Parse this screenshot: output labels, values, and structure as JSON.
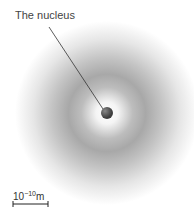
{
  "diagram": {
    "labels": {
      "nucleus": "The nucleus"
    },
    "scale_bar": {
      "base": "10",
      "exponent": "−10",
      "unit": "m"
    },
    "colors": {
      "background": "#ffffff",
      "cloud_dark": "#9a9a9a",
      "nucleus": "#555555",
      "leader_line": "#333333"
    }
  }
}
